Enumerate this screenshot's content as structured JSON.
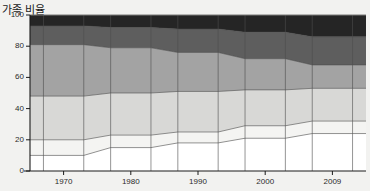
{
  "chart": {
    "title": "가족 비율",
    "ylabel": "",
    "xlabel": ""
  },
  "chart_data": {
    "type": "area",
    "title": "가족 비율",
    "xlabel": "",
    "ylabel": "",
    "ylim": [
      0,
      100
    ],
    "yticks": [
      0,
      20,
      40,
      60,
      80,
      100
    ],
    "ytick_labels": [
      "0",
      "20",
      "40",
      "60",
      "80",
      "100"
    ],
    "grid": false,
    "legend": "none",
    "stacked": true,
    "stack_total": 100,
    "categories": [
      "1970",
      "1980",
      "1990",
      "2000",
      "2009"
    ],
    "xtick_labels": [
      "1970",
      "1980",
      "1990",
      "2000",
      "2009"
    ],
    "series": [
      {
        "name": "series-1",
        "color": "#ffffff",
        "values": [
          10,
          15,
          18,
          21,
          24
        ]
      },
      {
        "name": "series-2",
        "color": "#f4f4f2",
        "values": [
          10,
          8,
          7,
          8,
          8
        ]
      },
      {
        "name": "series-3",
        "color": "#d8d8d6",
        "values": [
          28,
          27,
          26,
          23,
          21
        ]
      },
      {
        "name": "series-4",
        "color": "#a3a3a3",
        "values": [
          33,
          29,
          25,
          20,
          15
        ]
      },
      {
        "name": "series-5",
        "color": "#5e5e5e",
        "values": [
          12,
          13,
          15,
          17,
          18
        ]
      },
      {
        "name": "series-6",
        "color": "#252525",
        "values": [
          7,
          8,
          9,
          11,
          14
        ]
      }
    ],
    "cumulative_tops": {
      "1970": [
        10,
        20,
        48,
        81,
        93,
        100
      ],
      "1980": [
        15,
        23,
        50,
        79,
        92,
        100
      ],
      "1990": [
        18,
        25,
        51,
        76,
        91,
        100
      ],
      "2000": [
        21,
        29,
        52,
        72,
        89,
        100
      ],
      "2009": [
        24,
        32,
        53,
        68,
        86,
        100
      ]
    },
    "plot_background": "#eeeeec",
    "axis_color": "#1a1a1a",
    "band_line_color": "#4d4d4d"
  }
}
